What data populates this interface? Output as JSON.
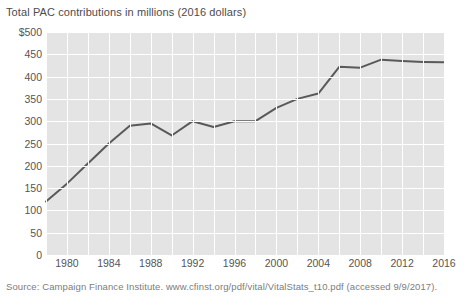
{
  "chart_data": {
    "type": "line",
    "title": "Total PAC contributions in millions (2016 dollars)",
    "xlabel": "",
    "ylabel": "",
    "ylim": [
      0,
      500
    ],
    "xlim": [
      1978,
      2016
    ],
    "grid": true,
    "legend_position": "none",
    "y_ticks": [
      "$500",
      "450",
      "400",
      "350",
      "300",
      "250",
      "200",
      "150",
      "100",
      "50",
      "0"
    ],
    "y_tick_values": [
      500,
      450,
      400,
      350,
      300,
      250,
      200,
      150,
      100,
      50,
      0
    ],
    "x_ticks": [
      "1980",
      "1984",
      "1988",
      "1992",
      "1996",
      "2000",
      "2004",
      "2008",
      "2012",
      "2016"
    ],
    "x_tick_values": [
      1980,
      1984,
      1988,
      1992,
      1996,
      2000,
      2004,
      2008,
      2012,
      2016
    ],
    "x": [
      1978,
      1980,
      1982,
      1984,
      1986,
      1988,
      1990,
      1992,
      1994,
      1996,
      1998,
      2000,
      2002,
      2004,
      2006,
      2008,
      2010,
      2012,
      2014,
      2016
    ],
    "values": [
      120,
      160,
      205,
      250,
      290,
      295,
      268,
      300,
      287,
      300,
      300,
      330,
      350,
      362,
      422,
      420,
      438,
      435,
      433,
      432
    ],
    "series": [
      {
        "name": "Total PAC contributions",
        "values": [
          120,
          160,
          205,
          250,
          290,
          295,
          268,
          300,
          287,
          300,
          300,
          330,
          350,
          362,
          422,
          420,
          438,
          435,
          433,
          432
        ]
      }
    ],
    "line_color": "#595959",
    "plot_background": "#e4e4e4",
    "grid_color": "#ffffff"
  },
  "footer": {
    "source": "Source: Campaign Finance Institute. www.cfinst.org/pdf/vital/VitalStats_t10.pdf (accessed 9/9/2017)."
  }
}
